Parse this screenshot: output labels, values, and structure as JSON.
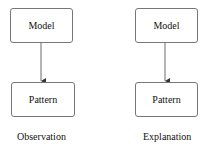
{
  "diagrams": [
    {
      "top_box": "Model",
      "bottom_box": "Pattern",
      "caption": "Observation"
    },
    {
      "top_box": "Model",
      "bottom_box": "Pattern",
      "caption": "Explanation"
    }
  ]
}
